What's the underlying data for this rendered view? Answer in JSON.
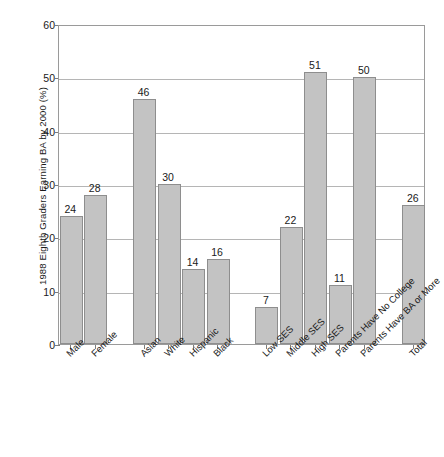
{
  "chart_data": {
    "type": "bar",
    "title": "",
    "xlabel": "",
    "ylabel": "1988 Eighth Graders Earning BA by 2000 (%)",
    "ylim": [
      0,
      60
    ],
    "yticks": [
      0,
      10,
      20,
      30,
      40,
      50,
      60
    ],
    "ytick_labels": [
      "0",
      "10",
      "20",
      "30",
      "40",
      "50",
      "60"
    ],
    "grid": "horizontal",
    "legend": "none",
    "bar_color": "#c3c3c3",
    "bar_border_color": "#8e8e8e",
    "grid_color": "#b5b5b5",
    "axis_color": "#9a9a9a",
    "categories": [
      "Male",
      "Female",
      "Asian",
      "White",
      "Hispanic",
      "Black",
      "Low SES",
      "Middle SES",
      "High SES",
      "Parents Have No College",
      "Parents Have BA or More",
      "Total"
    ],
    "values": [
      24,
      28,
      46,
      30,
      14,
      16,
      7,
      22,
      51,
      50,
      11,
      26
    ],
    "bars": [
      {
        "label": "Male",
        "value": 24,
        "slot": 0
      },
      {
        "label": "Female",
        "value": 28,
        "slot": 1
      },
      {
        "label": "Asian",
        "value": 46,
        "slot": 3
      },
      {
        "label": "White",
        "value": 30,
        "slot": 4
      },
      {
        "label": "Hispanic",
        "value": 14,
        "slot": 5
      },
      {
        "label": "Black",
        "value": 16,
        "slot": 6
      },
      {
        "label": "Low SES",
        "value": 7,
        "slot": 8
      },
      {
        "label": "Middle SES",
        "value": 22,
        "slot": 9
      },
      {
        "label": "High SES",
        "value": 51,
        "slot": 10
      },
      {
        "label": "Parents Have No College",
        "value": 11,
        "slot": 11
      },
      {
        "label": "Parents Have BA or More",
        "value": 50,
        "slot": 12
      },
      {
        "label": "Total",
        "value": 26,
        "slot": 14
      }
    ],
    "groups": [
      {
        "name": "Gender",
        "categories": [
          "Male",
          "Female"
        ]
      },
      {
        "name": "Race/Ethnicity",
        "categories": [
          "Asian",
          "White",
          "Hispanic",
          "Black"
        ]
      },
      {
        "name": "Socioeconomic Status",
        "categories": [
          "Low SES",
          "Middle SES",
          "High SES"
        ]
      },
      {
        "name": "Parent Education",
        "categories": [
          "Parents Have No College",
          "Parents Have BA or More"
        ]
      },
      {
        "name": "All",
        "categories": [
          "Total"
        ]
      }
    ]
  }
}
